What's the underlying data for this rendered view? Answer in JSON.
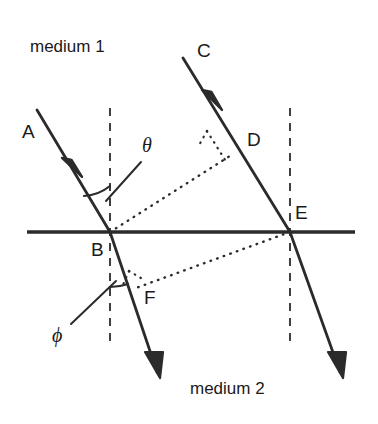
{
  "figure": {
    "background_color": "#ffffff",
    "stroke_color": "#2b2b2b",
    "text_color": "#1a1a1a",
    "width": 378,
    "height": 424
  },
  "labels": {
    "medium_top": "medium 1",
    "medium_bottom": "medium 2",
    "point_a": "A",
    "point_b": "B",
    "point_c": "C",
    "point_d": "D",
    "point_e": "E",
    "point_f": "F",
    "angle_incidence": "θ",
    "angle_refraction": "ϕ"
  },
  "geometry": {
    "interface_y": 232,
    "interface_x_start": 27,
    "interface_x_end": 355,
    "normal_left_x": 110,
    "normal_right_x": 290,
    "normal_y_top": 108,
    "normal_y_bottom": 345,
    "point_b": [
      110,
      232
    ],
    "point_e": [
      290,
      232
    ],
    "ray_a_start": [
      37,
      110
    ],
    "ray_c_start": [
      183,
      58
    ],
    "ray_a_arrow": [
      72,
      167
    ],
    "ray_c_arrow": [
      212,
      100
    ],
    "refracted_b_end": [
      157,
      372
    ],
    "refracted_e_end": [
      340,
      372
    ],
    "wavefront_bd_start": [
      110,
      232
    ],
    "wavefront_bd_end": [
      233,
      154
    ],
    "wavefront_ef_start": [
      290,
      232
    ],
    "wavefront_ef_end": [
      136,
      288
    ]
  }
}
